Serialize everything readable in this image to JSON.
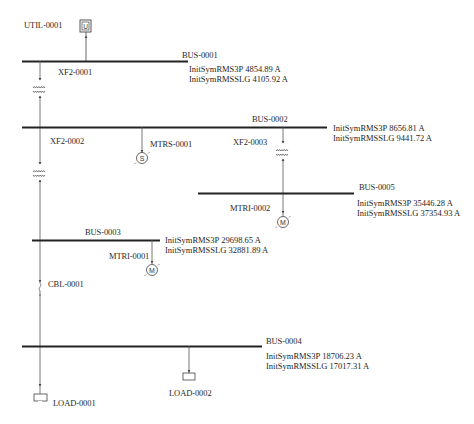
{
  "diagram": {
    "type": "single-line electrical diagram (short-circuit results)",
    "background": "#ffffff",
    "line_color": "#333333",
    "bus_color": "#222222"
  },
  "utility": {
    "id": "UTIL-0001",
    "symbol": "U"
  },
  "buses": [
    {
      "id": "BUS-0001",
      "result_3p_label": "InitSymRMS3P",
      "result_3p": "4854.89 A",
      "result_slg_label": "InitSymRMSSLG",
      "result_slg": "4105.92 A"
    },
    {
      "id": "BUS-0002",
      "result_3p_label": "InitSymRMS3P",
      "result_3p": "8656.81 A",
      "result_slg_label": "InitSymRMSSLG",
      "result_slg": "9441.72 A"
    },
    {
      "id": "BUS-0003",
      "result_3p_label": "InitSymRMS3P",
      "result_3p": "29698.65 A",
      "result_slg_label": "InitSymRMSSLG",
      "result_slg": "32881.89 A"
    },
    {
      "id": "BUS-0004",
      "result_3p_label": "InitSymRMS3P",
      "result_3p": "18706.23 A",
      "result_slg_label": "InitSymRMSSLG",
      "result_slg": "17017.31 A"
    },
    {
      "id": "BUS-0005",
      "result_3p_label": "InitSymRMS3P",
      "result_3p": "35446.28 A",
      "result_slg_label": "InitSymRMSSLG",
      "result_slg": "37354.93 A"
    }
  ],
  "transformers": [
    {
      "id": "XF2-0001",
      "from": "BUS-0001",
      "to": "BUS-0002"
    },
    {
      "id": "XF2-0002",
      "from": "BUS-0002",
      "to": "BUS-0003"
    },
    {
      "id": "XF2-0003",
      "from": "BUS-0002",
      "to": "BUS-0005"
    }
  ],
  "motors": [
    {
      "id": "MTRS-0001",
      "symbol": "S",
      "bus": "BUS-0002"
    },
    {
      "id": "MTRI-0001",
      "symbol": "M",
      "bus": "BUS-0003"
    },
    {
      "id": "MTRI-0002",
      "symbol": "M",
      "bus": "BUS-0005"
    }
  ],
  "cables": [
    {
      "id": "CBL-0001",
      "from": "BUS-0003",
      "to": "BUS-0004"
    }
  ],
  "loads": [
    {
      "id": "LOAD-0001",
      "bus": "BUS-0004"
    },
    {
      "id": "LOAD-0002",
      "bus": "BUS-0004"
    }
  ]
}
